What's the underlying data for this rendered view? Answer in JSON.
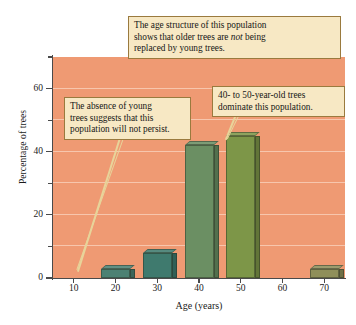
{
  "figure": {
    "background_color": "#ffffff",
    "plot_background_color": "#ef9a73",
    "gridline_color": "#f7c6ad",
    "callout_fill": "#f7e8c4",
    "callout_border": "#9a7a3e",
    "leader_color": "#e8d49a"
  },
  "chart_data": {
    "type": "bar",
    "title": "",
    "xlabel": "Age (years)",
    "ylabel": "Percentage of trees",
    "categories": [
      "10",
      "20",
      "30",
      "40",
      "50",
      "60",
      "70"
    ],
    "values": [
      0,
      3,
      8,
      42,
      45,
      0,
      3
    ],
    "bar_colors": [
      "#ef9a73",
      "#4c8173",
      "#3f7a6e",
      "#6b8f63",
      "#7d9648",
      "#ef9a73",
      "#8f8f5a"
    ],
    "ylim": [
      0,
      70
    ],
    "xlim_categories": 7,
    "y_major_ticks": [
      0,
      20,
      40,
      60
    ],
    "y_minor_ticks": [
      10,
      30,
      50,
      70
    ],
    "y_tick_labels": [
      "0",
      "20",
      "40",
      "60"
    ],
    "x_tick_labels": [
      "10",
      "20",
      "30",
      "40",
      "50",
      "60",
      "70"
    ],
    "grid": "horizontal",
    "legend": "none",
    "annotations": [
      {
        "id": "top",
        "text_parts": [
          "The age structure of this population shows that older trees are ",
          "not",
          " being replaced by young trees."
        ],
        "italic_word": "not",
        "points_to": "plot-top"
      },
      {
        "id": "left",
        "text_parts": [
          "The absence of young trees suggests that this population will not persist."
        ],
        "points_to": "age-10-category"
      },
      {
        "id": "right",
        "text_parts": [
          "40- to 50-year-old trees dominate this population."
        ],
        "points_to": "age-50-bar"
      }
    ]
  },
  "axes": {
    "y_title": "Percentage of trees",
    "x_title": "Age (years)",
    "y_labels": [
      "60",
      "40",
      "20",
      "0"
    ],
    "x_labels": [
      "10",
      "20",
      "30",
      "40",
      "50",
      "60",
      "70"
    ]
  },
  "callouts": {
    "top": {
      "line1_a": "The age structure of this population",
      "line2_a": "shows that older trees are ",
      "line2_em": "not",
      "line2_b": " being",
      "line3": "replaced by young trees."
    },
    "left": {
      "line1": "The absence of young",
      "line2": "trees suggests that this",
      "line3": "population will not persist."
    },
    "right": {
      "line1": "40- to 50-year-old trees",
      "line2": "dominate this population."
    }
  }
}
